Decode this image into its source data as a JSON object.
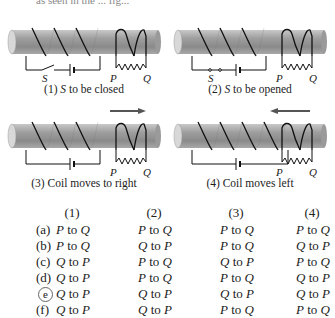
{
  "figure": {
    "cut_top_text": "as seen in the ... fig...",
    "panels": [
      {
        "id": 1,
        "number": "(1)",
        "caption_var": "S",
        "caption_rest": " to be closed",
        "switch_label": "S",
        "p_label": "P",
        "q_label": "Q",
        "switch_state": "open",
        "arrow": "none"
      },
      {
        "id": 2,
        "number": "(2)",
        "caption_var": "S",
        "caption_rest": " to be opened",
        "switch_label": "S",
        "p_label": "P",
        "q_label": "Q",
        "switch_state": "closed",
        "arrow": "none"
      },
      {
        "id": 3,
        "number": "(3)",
        "caption_var": "",
        "caption_rest": "Coil moves to right",
        "switch_label": "",
        "p_label": "P",
        "q_label": "Q",
        "switch_state": "none",
        "arrow": "right"
      },
      {
        "id": 4,
        "number": "(4)",
        "caption_var": "",
        "caption_rest": "Coil moves left",
        "switch_label": "",
        "p_label": "P",
        "q_label": "Q",
        "switch_state": "none",
        "arrow": "left"
      }
    ]
  },
  "answer_table": {
    "headers": [
      "(1)",
      "(2)",
      "(3)",
      "(4)"
    ],
    "rows": [
      {
        "option": "(a)",
        "circled": false,
        "cells": [
          [
            "P",
            "Q"
          ],
          [
            "P",
            "Q"
          ],
          [
            "P",
            "Q"
          ],
          [
            "P",
            "Q"
          ]
        ]
      },
      {
        "option": "(b)",
        "circled": false,
        "cells": [
          [
            "P",
            "Q"
          ],
          [
            "Q",
            "P"
          ],
          [
            "P",
            "Q"
          ],
          [
            "Q",
            "P"
          ]
        ]
      },
      {
        "option": "(c)",
        "circled": false,
        "cells": [
          [
            "Q",
            "P"
          ],
          [
            "P",
            "Q"
          ],
          [
            "Q",
            "P"
          ],
          [
            "P",
            "Q"
          ]
        ]
      },
      {
        "option": "(d)",
        "circled": false,
        "cells": [
          [
            "Q",
            "P"
          ],
          [
            "P",
            "Q"
          ],
          [
            "P",
            "Q"
          ],
          [
            "Q",
            "P"
          ]
        ]
      },
      {
        "option": "e",
        "circled": true,
        "cells": [
          [
            "Q",
            "P"
          ],
          [
            "Q",
            "P"
          ],
          [
            "Q",
            "P"
          ],
          [
            "Q",
            "P"
          ]
        ]
      },
      {
        "option": "(f)",
        "circled": false,
        "cells": [
          [
            "Q",
            "P"
          ],
          [
            "Q",
            "P"
          ],
          [
            "P",
            "Q"
          ],
          [
            "P",
            "Q"
          ]
        ]
      }
    ],
    "connector": "to"
  }
}
